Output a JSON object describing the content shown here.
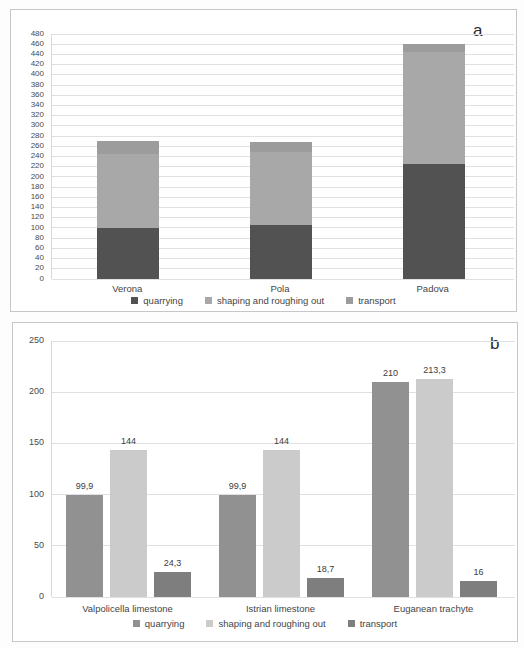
{
  "figure": {
    "panel_a_label": "a",
    "panel_b_label": "b"
  },
  "chart_data": [
    {
      "type": "bar",
      "stacked": true,
      "panel_label": "a",
      "title": "",
      "categories": [
        "Verona",
        "Pola",
        "Padova"
      ],
      "series": [
        {
          "name": "quarrying",
          "color": "#525252",
          "values": [
            100,
            105,
            225
          ]
        },
        {
          "name": "shaping and roughing out",
          "color": "#a8a8a8",
          "values": [
            145,
            143,
            220
          ]
        },
        {
          "name": "transport",
          "color": "#9c9c9c",
          "values": [
            25,
            20,
            15
          ]
        }
      ],
      "ylim": [
        0,
        480
      ],
      "ytick_step": 20,
      "yticks": [
        "0",
        "20",
        "40",
        "60",
        "80",
        "100",
        "120",
        "140",
        "160",
        "180",
        "200",
        "220",
        "240",
        "260",
        "280",
        "300",
        "320",
        "340",
        "360",
        "380",
        "400",
        "420",
        "440",
        "460",
        "480"
      ],
      "grid": true,
      "legend_position": "bottom",
      "legend": [
        "quarrying",
        "shaping and roughing out",
        "transport"
      ],
      "note": "segment values estimated from gridlines; bars are unlabeled in the figure"
    },
    {
      "type": "bar",
      "stacked": false,
      "panel_label": "b",
      "title": "",
      "categories": [
        "Valpolicella limestone",
        "Istrian limestone",
        "Euganean trachyte"
      ],
      "series": [
        {
          "name": "quarrying",
          "color": "#919191",
          "values": [
            99.9,
            99.9,
            210
          ],
          "labels": [
            "99,9",
            "99,9",
            "210"
          ]
        },
        {
          "name": "shaping and roughing out",
          "color": "#cbcbcb",
          "values": [
            144,
            144,
            213.3
          ],
          "labels": [
            "144",
            "144",
            "213,3"
          ]
        },
        {
          "name": "transport",
          "color": "#7e7e7e",
          "values": [
            24.3,
            18.7,
            16
          ],
          "labels": [
            "24,3",
            "18,7",
            "16"
          ]
        }
      ],
      "ylim": [
        0,
        250
      ],
      "ytick_step": 50,
      "yticks": [
        "0",
        "50",
        "100",
        "150",
        "200",
        "250"
      ],
      "grid": true,
      "legend_position": "bottom",
      "legend": [
        "quarrying",
        "shaping and roughing out",
        "transport"
      ]
    }
  ]
}
